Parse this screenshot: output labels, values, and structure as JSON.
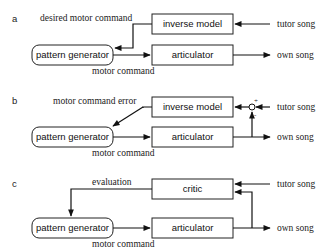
{
  "panels": {
    "a": {
      "label": "a",
      "boxes": {
        "inverse_model": "inverse model",
        "articulator": "articulator",
        "pattern_generator": "pattern generator"
      },
      "signals": {
        "desired_motor_command": "desired motor command",
        "motor_command": "motor command",
        "tutor_song": "tutor song",
        "own_song": "own song"
      }
    },
    "b": {
      "label": "b",
      "boxes": {
        "inverse_model": "inverse model",
        "articulator": "articulator",
        "pattern_generator": "pattern generator"
      },
      "signals": {
        "motor_command_error": "motor command error",
        "motor_command": "motor command",
        "tutor_song": "tutor song",
        "own_song": "own song"
      },
      "junction": {
        "plus": "+",
        "minus": "-"
      }
    },
    "c": {
      "label": "c",
      "boxes": {
        "critic": "critic",
        "articulator": "articulator",
        "pattern_generator": "pattern generator"
      },
      "signals": {
        "evaluation": "evaluation",
        "motor_command": "motor command",
        "tutor_song": "tutor song",
        "own_song": "own song"
      }
    }
  }
}
